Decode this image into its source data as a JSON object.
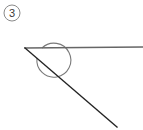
{
  "figure": {
    "kind": "geometry-angle-diagram",
    "width": 143,
    "height": 130,
    "background_color": "#ffffff",
    "label": {
      "text": "3",
      "shape": "circled-number",
      "center_x": 12,
      "center_y": 13,
      "radius": 8,
      "text_color": "#3a3a3a",
      "circle_color": "#8a8a8a"
    },
    "vertex": {
      "x": 25,
      "y": 48
    },
    "rays": [
      {
        "name": "horizontal-ray",
        "from_x": 25,
        "from_y": 48,
        "to_x": 143,
        "to_y": 47,
        "color": "#666666",
        "width": 1.4
      },
      {
        "name": "diagonal-ray",
        "from_x": 25,
        "from_y": 48,
        "to_x": 117,
        "to_y": 127,
        "color": "#232323",
        "width": 1.4
      }
    ],
    "angle_arc": {
      "name": "reflex-angle-arc",
      "center_x": 25,
      "center_y": 48,
      "radius": 17,
      "color": "#7a7a7a",
      "width": 1.1,
      "type": "reflex",
      "start_x": 37,
      "start_y": 58,
      "end_x": 42,
      "end_y": 48,
      "large_arc_flag": 1,
      "sweep_flag": 0
    }
  }
}
